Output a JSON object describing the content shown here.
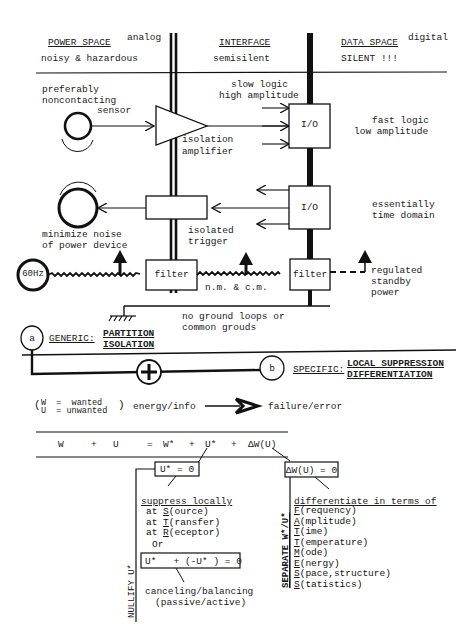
{
  "header": {
    "power_space": {
      "title": "POWER SPACE",
      "tag": "analog",
      "subtitle": "noisy & hazardous"
    },
    "interface": {
      "title": "INTERFACE",
      "subtitle": "semisilent"
    },
    "data_space": {
      "title": "DATA SPACE",
      "tag": "digital",
      "subtitle": "SILENT !!!"
    }
  },
  "blocks": {
    "sensor_label": [
      "preferably",
      "noncontacting",
      "sensor"
    ],
    "slow_logic": [
      "slow logic",
      "high amplitude"
    ],
    "io_top": "I/O",
    "fast_logic": [
      "fast logic",
      "low amplitude"
    ],
    "isolation_amplifier": [
      "isolation",
      "amplifier"
    ],
    "io_mid": "I/O",
    "time_domain": [
      "essentially",
      "time domain"
    ],
    "power_device": [
      "minimize noise",
      "of power device"
    ],
    "isolated_trigger": [
      "isolated",
      "trigger"
    ],
    "source_60hz": "60Hz",
    "filter_left": "filter",
    "noise_modes": "n.m. & c.m.",
    "filter_right": "filter",
    "standby_power": [
      "regulated",
      "standby",
      "power"
    ],
    "ground_note": [
      "no ground loops or",
      "common grouds"
    ]
  },
  "generic": {
    "node": "a",
    "label": "GENERIC:",
    "terms": [
      "PARTITION",
      "ISOLATION"
    ]
  },
  "specific": {
    "node": "b",
    "label": "SPECIFIC:",
    "terms": [
      "LOCAL SUPPRESSION",
      "DIFFERENTIATION"
    ],
    "sum_symbol": "+"
  },
  "legend": {
    "w_def": "W  =  wanted",
    "u_def": "U  = unwanted",
    "energy_info": "energy/info",
    "failure_error": "failure/error"
  },
  "equation": {
    "terms": [
      "W",
      "+",
      "U",
      "=",
      "W*",
      "+",
      "U*",
      "+",
      "ΔW(U)"
    ]
  },
  "nullify": {
    "box": "U* = 0",
    "side_label": "NULLIFY U*",
    "heading": "suppress locally",
    "items": [
      {
        "prefix": "at",
        "key": "S",
        "rest": "(ource)"
      },
      {
        "prefix": "at",
        "key": "T",
        "rest": "(ransfer)"
      },
      {
        "prefix": "at",
        "key": "R",
        "rest": "(eceptor)"
      }
    ],
    "or": "Or",
    "balance_box": "U*   + (-U* ) = 0",
    "balance_note": [
      "canceling/balancing",
      "(passive/active)"
    ]
  },
  "separate": {
    "box": "ΔW(U) = 0",
    "side_label": "SEPARATE W*/U*",
    "heading": "differentiate in terms of",
    "items": [
      {
        "key": "F",
        "rest": "(requency)"
      },
      {
        "key": "A",
        "rest": "(mplitude)"
      },
      {
        "key": "T",
        "rest": "(ime)"
      },
      {
        "key": "T",
        "rest": "(emperature)"
      },
      {
        "key": "M",
        "rest": "(ode)"
      },
      {
        "key": "E",
        "rest": "(nergy)"
      },
      {
        "key": "S",
        "rest": "(pace,structure)"
      },
      {
        "key": "S",
        "rest": "(tatistics)"
      }
    ]
  }
}
